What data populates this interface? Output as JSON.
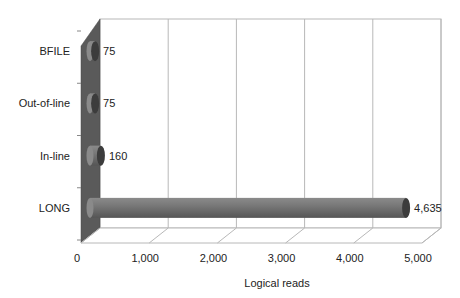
{
  "chart_data": {
    "type": "bar",
    "orientation": "horizontal",
    "style": "3d-cylinder",
    "title": "",
    "xlabel": "Logical reads",
    "ylabel": "",
    "categories": [
      "BFILE",
      "Out-of-line",
      "In-line",
      "LONG"
    ],
    "values": [
      75,
      75,
      160,
      4635
    ],
    "data_labels": [
      "75",
      "75",
      "160",
      "4,635"
    ],
    "xlim": [
      0,
      5000
    ],
    "x_ticks": [
      0,
      1000,
      2000,
      3000,
      4000,
      5000
    ],
    "x_tick_labels": [
      "0",
      "1,000",
      "2,000",
      "3,000",
      "4,000",
      "5,000"
    ],
    "grid": true,
    "legend": null,
    "colors": {
      "bar": "#6e6e6e",
      "bar_end": "#3c3c3c",
      "wall": "#5a5a5a",
      "grid": "#b8b8b8"
    }
  }
}
